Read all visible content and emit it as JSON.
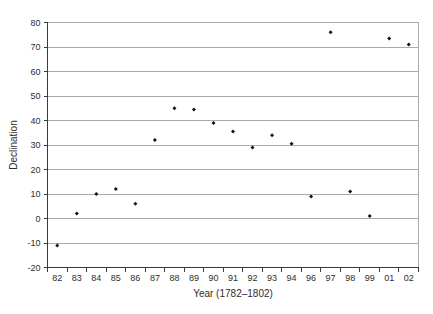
{
  "page": {
    "background": "#ffffff"
  },
  "chart_data": {
    "type": "scatter",
    "title": "",
    "xlabel": "Year (1782–1802)",
    "ylabel": "Declination",
    "categories": [
      "82",
      "83",
      "84",
      "85",
      "86",
      "87",
      "88",
      "89",
      "90",
      "91",
      "92",
      "93",
      "94",
      "96",
      "97",
      "98",
      "99",
      "01",
      "02"
    ],
    "values": [
      -11,
      2,
      10,
      12,
      6,
      32,
      45,
      44.5,
      39,
      35.5,
      29,
      34,
      30.5,
      9,
      76,
      11,
      1,
      73.5,
      71
    ],
    "ylim": [
      -20,
      80
    ],
    "yticks": [
      -20,
      -10,
      0,
      10,
      20,
      30,
      40,
      50,
      60,
      70,
      80
    ],
    "grid": true,
    "legend": "none",
    "marker": {
      "shape": "diamond",
      "color": "#111111",
      "size": 4
    },
    "colors": {
      "gridline": "#aaaaaa",
      "axis": "#3a3a3a",
      "text": "#2e2e2e",
      "plot_border": "#aaaaaa",
      "background": "#ffffff"
    }
  }
}
